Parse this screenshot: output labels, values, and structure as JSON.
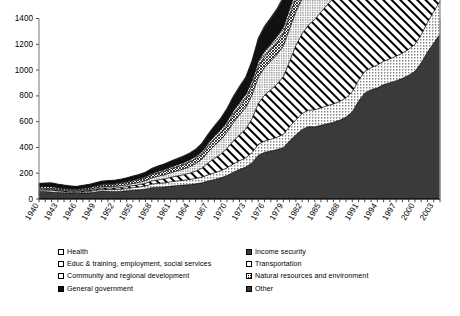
{
  "chart_data": {
    "type": "area",
    "title": "",
    "subtitle": "",
    "xlabel": "",
    "ylabel": "",
    "stacked": true,
    "grid": false,
    "legend_position": "bottom",
    "ylim": [
      0,
      1400
    ],
    "ytick_labels": [
      "0",
      "200",
      "400",
      "600",
      "800",
      "1000",
      "1200",
      "1400"
    ],
    "ytick_values": [
      0,
      200,
      400,
      600,
      800,
      1000,
      1200,
      1400
    ],
    "xlim": [
      1940,
      2004
    ],
    "xtick_labels": [
      "1940",
      "1943",
      "1946",
      "1949",
      "1952",
      "1955",
      "1958",
      "1961",
      "1964",
      "1967",
      "1970",
      "1973",
      "1976",
      "1979",
      "1982",
      "1985",
      "1988",
      "1991",
      "1994",
      "1997",
      "2000",
      "2003"
    ],
    "x": [
      1940,
      1941,
      1942,
      1943,
      1944,
      1945,
      1946,
      1947,
      1948,
      1949,
      1950,
      1951,
      1952,
      1953,
      1954,
      1955,
      1956,
      1957,
      1958,
      1959,
      1960,
      1961,
      1962,
      1963,
      1964,
      1965,
      1966,
      1967,
      1968,
      1969,
      1970,
      1971,
      1972,
      1973,
      1974,
      1975,
      1976,
      1977,
      1978,
      1979,
      1980,
      1981,
      1982,
      1983,
      1984,
      1985,
      1986,
      1987,
      1988,
      1989,
      1990,
      1991,
      1992,
      1993,
      1994,
      1995,
      1996,
      1997,
      1998,
      1999,
      2000,
      2001,
      2002,
      2003,
      2004
    ],
    "series": [
      {
        "name": "Income security",
        "pattern": "dark-solid",
        "color": "#3a3a3a",
        "values": [
          60,
          58,
          55,
          50,
          48,
          46,
          44,
          46,
          48,
          55,
          62,
          60,
          58,
          60,
          64,
          68,
          72,
          78,
          88,
          92,
          94,
          100,
          104,
          108,
          112,
          118,
          126,
          140,
          152,
          164,
          182,
          208,
          230,
          248,
          282,
          340,
          362,
          372,
          384,
          400,
          452,
          498,
          540,
          562,
          560,
          572,
          584,
          596,
          612,
          636,
          676,
          760,
          822,
          848,
          862,
          888,
          902,
          918,
          936,
          960,
          990,
          1056,
          1140,
          1210,
          1280
        ]
      },
      {
        "name": "Transportation",
        "pattern": "dots",
        "color": "#ffffff",
        "values": [
          10,
          12,
          14,
          12,
          10,
          9,
          9,
          10,
          11,
          12,
          13,
          14,
          15,
          16,
          18,
          20,
          22,
          24,
          28,
          30,
          32,
          34,
          36,
          38,
          40,
          42,
          44,
          48,
          52,
          56,
          60,
          64,
          68,
          72,
          78,
          84,
          88,
          92,
          96,
          102,
          110,
          118,
          124,
          128,
          132,
          136,
          140,
          142,
          146,
          150,
          156,
          162,
          168,
          172,
          178,
          182,
          186,
          190,
          196,
          202,
          210,
          220,
          232,
          244,
          256
        ]
      },
      {
        "name": "Health",
        "pattern": "white-diag",
        "color": "#ffffff",
        "values": [
          6,
          6,
          6,
          6,
          6,
          6,
          6,
          7,
          8,
          9,
          10,
          11,
          12,
          13,
          14,
          16,
          18,
          20,
          24,
          27,
          30,
          34,
          38,
          42,
          48,
          56,
          70,
          92,
          112,
          128,
          150,
          178,
          200,
          222,
          264,
          318,
          356,
          384,
          412,
          448,
          508,
          576,
          620,
          660,
          700,
          742,
          784,
          818,
          870,
          940,
          1040,
          1180,
          1340,
          1420,
          1480,
          1560,
          1620,
          1680,
          1740,
          1820,
          1920,
          2060,
          2260,
          2460,
          2640
        ]
      },
      {
        "name": "Educ & training, employment, social services",
        "pattern": "dots-fine",
        "color": "#ffffff",
        "values": [
          8,
          8,
          8,
          8,
          8,
          7,
          7,
          8,
          9,
          10,
          11,
          12,
          13,
          14,
          15,
          16,
          18,
          20,
          24,
          28,
          32,
          36,
          40,
          44,
          50,
          58,
          70,
          86,
          100,
          112,
          126,
          142,
          156,
          168,
          184,
          204,
          214,
          222,
          230,
          238,
          252,
          262,
          268,
          272,
          278,
          284,
          290,
          296,
          304,
          314,
          328,
          344,
          360,
          372,
          384,
          398,
          410,
          420,
          432,
          446,
          462,
          486,
          520,
          552,
          584
        ]
      },
      {
        "name": "Natural resources and environment",
        "pattern": "cross-hatch",
        "color": "#ffffff",
        "values": [
          12,
          13,
          13,
          12,
          11,
          10,
          10,
          11,
          12,
          13,
          14,
          15,
          16,
          17,
          18,
          19,
          20,
          22,
          24,
          26,
          28,
          30,
          32,
          34,
          36,
          38,
          40,
          44,
          48,
          52,
          56,
          60,
          64,
          68,
          74,
          80,
          84,
          88,
          92,
          96,
          102,
          108,
          112,
          114,
          116,
          118,
          120,
          122,
          124,
          126,
          130,
          134,
          138,
          140,
          142,
          146,
          148,
          150,
          154,
          158,
          162,
          168,
          176,
          184,
          192
        ]
      },
      {
        "name": "Community and regional development",
        "pattern": "cross-light",
        "color": "#ffffff",
        "values": [
          4,
          4,
          4,
          4,
          4,
          4,
          4,
          5,
          5,
          6,
          6,
          7,
          7,
          8,
          8,
          9,
          9,
          10,
          11,
          12,
          13,
          14,
          15,
          16,
          17,
          18,
          20,
          22,
          24,
          26,
          28,
          30,
          32,
          34,
          38,
          42,
          44,
          46,
          48,
          50,
          54,
          56,
          58,
          58,
          58,
          58,
          58,
          58,
          58,
          58,
          60,
          62,
          64,
          64,
          66,
          68,
          68,
          70,
          72,
          74,
          76,
          80,
          84,
          88,
          92
        ]
      },
      {
        "name": "General government",
        "pattern": "black-solid",
        "color": "#111111",
        "values": [
          18,
          20,
          22,
          20,
          18,
          16,
          15,
          16,
          17,
          18,
          19,
          20,
          21,
          22,
          24,
          26,
          28,
          30,
          34,
          36,
          38,
          40,
          42,
          44,
          46,
          50,
          56,
          64,
          72,
          80,
          90,
          102,
          112,
          122,
          140,
          164,
          176,
          186,
          198,
          214,
          246,
          274,
          292,
          300,
          308,
          316,
          322,
          326,
          330,
          336,
          344,
          352,
          360,
          364,
          368,
          374,
          378,
          382,
          388,
          394,
          402,
          416,
          436,
          456,
          476
        ]
      },
      {
        "name": "Other",
        "pattern": "dark-solid-2",
        "color": "#2a2a2a",
        "values": [
          4,
          4,
          4,
          4,
          4,
          4,
          4,
          4,
          4,
          4,
          4,
          4,
          4,
          4,
          4,
          5,
          5,
          5,
          6,
          6,
          6,
          7,
          7,
          7,
          8,
          8,
          9,
          10,
          10,
          11,
          12,
          13,
          14,
          15,
          16,
          18,
          19,
          20,
          20,
          21,
          22,
          24,
          25,
          25,
          26,
          26,
          27,
          27,
          28,
          28,
          29,
          30,
          31,
          31,
          32,
          33,
          33,
          34,
          35,
          36,
          37,
          38,
          40,
          42,
          44
        ]
      }
    ],
    "stack_totals_note": "Series are plotted as a stacked area of billions of dollars of federal outlays by function."
  },
  "legend": {
    "columns": [
      [
        {
          "label": "Health",
          "swatch": "white-box-icon"
        },
        {
          "label": "Educ & training, employment, social services",
          "swatch": "fine-dot-box-icon"
        },
        {
          "label": "Community and regional development",
          "swatch": "cross-hatch-box-icon"
        },
        {
          "label": "General government",
          "swatch": "black-box-icon"
        }
      ],
      [
        {
          "label": "Income security",
          "swatch": "dark-box-icon"
        },
        {
          "label": "Transportation",
          "swatch": "dot-box-icon"
        },
        {
          "label": "Natural resources and environment",
          "swatch": "diag-box-icon"
        },
        {
          "label": "Other",
          "swatch": "dark-box-icon"
        }
      ]
    ]
  },
  "axes": {
    "y_labels": [
      "1400",
      "1200",
      "1000",
      "800",
      "600",
      "400",
      "200",
      "0"
    ],
    "x_labels": [
      "1940",
      "1943",
      "1946",
      "1949",
      "1952",
      "1955",
      "1958",
      "1961",
      "1964",
      "1967",
      "1970",
      "1973",
      "1976",
      "1979",
      "1982",
      "1985",
      "1988",
      "1991",
      "1994",
      "1997",
      "2000",
      "2003"
    ]
  }
}
